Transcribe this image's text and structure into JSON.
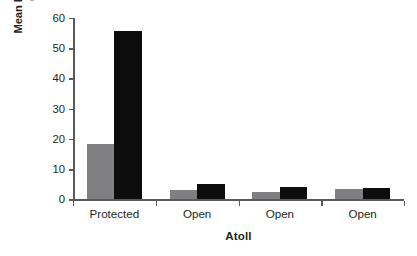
{
  "chart_data": {
    "type": "bar",
    "title": "",
    "xlabel": "Atoll",
    "ylabel": "Mean holothurian density (nos./200 m²)",
    "ylabel_line1": "Mean holothurian density",
    "ylabel_line2_pre": "(nos./200 m",
    "ylabel_line2_sup": "2",
    "ylabel_line2_post": ")",
    "categories": [
      "Protected",
      "Open",
      "Open",
      "Open"
    ],
    "series": [
      {
        "name": "gray-series",
        "color": "#808083",
        "values": [
          18.4,
          3.0,
          2.6,
          3.6
        ]
      },
      {
        "name": "black-series",
        "color": "#0d0d0d",
        "values": [
          55.7,
          5.2,
          4.1,
          3.7
        ]
      }
    ],
    "ylim": [
      0,
      60
    ],
    "yticks": [
      0,
      10,
      20,
      30,
      40,
      50,
      60
    ],
    "ytick_labels": [
      "0",
      "10",
      "20",
      "30",
      "40",
      "50",
      "60"
    ],
    "grid": false,
    "legend": "none",
    "axis_color": "#58595b"
  },
  "axis": {
    "y_ticks": [
      {
        "value": 60,
        "label": "60"
      },
      {
        "value": 50,
        "label": "50"
      },
      {
        "value": 40,
        "label": "40"
      },
      {
        "value": 30,
        "label": "30"
      },
      {
        "value": 20,
        "label": "20"
      },
      {
        "value": 10,
        "label": "10"
      },
      {
        "value": 0,
        "label": "0"
      }
    ],
    "x_categories": [
      {
        "label": "Protected"
      },
      {
        "label": "Open"
      },
      {
        "label": "Open"
      },
      {
        "label": "Open"
      }
    ],
    "x_title": "Atoll"
  }
}
